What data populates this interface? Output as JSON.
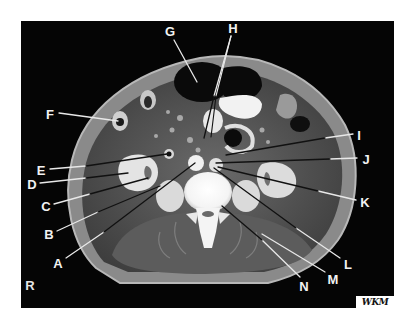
{
  "figure": {
    "type": "axial CT cross-section with lettered leader labels",
    "orientation_marker": "R",
    "credit": "WKM",
    "colors": {
      "background": "#ffffff",
      "panel": "#050505",
      "label_text": "#f2f2f2",
      "leader_light": "#e8e8e8",
      "leader_dark": "#111111"
    }
  },
  "labels": [
    {
      "id": "A",
      "text": "A",
      "x": 58,
      "y": 263
    },
    {
      "id": "B",
      "text": "B",
      "x": 49,
      "y": 234
    },
    {
      "id": "C",
      "text": "C",
      "x": 46,
      "y": 206
    },
    {
      "id": "D",
      "text": "D",
      "x": 32,
      "y": 184
    },
    {
      "id": "E",
      "text": "E",
      "x": 41,
      "y": 170
    },
    {
      "id": "F",
      "text": "F",
      "x": 50,
      "y": 114
    },
    {
      "id": "G",
      "text": "G",
      "x": 170,
      "y": 31
    },
    {
      "id": "H",
      "text": "H",
      "x": 233,
      "y": 28
    },
    {
      "id": "I",
      "text": "I",
      "x": 359,
      "y": 135
    },
    {
      "id": "J",
      "text": "J",
      "x": 366,
      "y": 159
    },
    {
      "id": "K",
      "text": "K",
      "x": 365,
      "y": 202
    },
    {
      "id": "L",
      "text": "L",
      "x": 348,
      "y": 264
    },
    {
      "id": "M",
      "text": "M",
      "x": 333,
      "y": 279
    },
    {
      "id": "N",
      "text": "N",
      "x": 304,
      "y": 286
    }
  ]
}
